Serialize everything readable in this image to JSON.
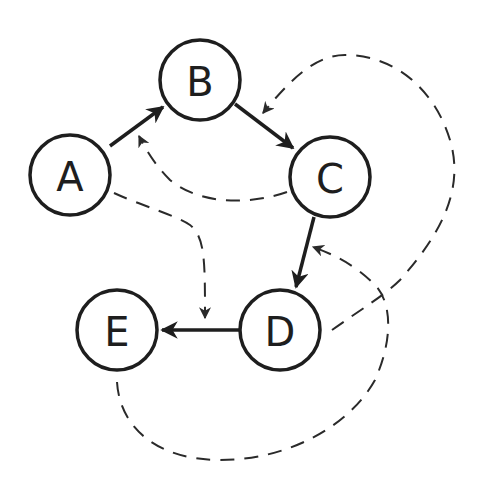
{
  "diagram": {
    "type": "directed-graph",
    "colors": {
      "stroke": "#1e1e1e",
      "background": "#ffffff"
    },
    "nodes": [
      {
        "id": "A",
        "label": "A",
        "cx": 70,
        "cy": 175
      },
      {
        "id": "B",
        "label": "B",
        "cx": 200,
        "cy": 80
      },
      {
        "id": "C",
        "label": "C",
        "cx": 330,
        "cy": 177
      },
      {
        "id": "D",
        "label": "D",
        "cx": 280,
        "cy": 330
      },
      {
        "id": "E",
        "label": "E",
        "cx": 117,
        "cy": 330
      }
    ],
    "solid_edges": [
      {
        "from": "A",
        "to": "B"
      },
      {
        "from": "B",
        "to": "C"
      },
      {
        "from": "C",
        "to": "D"
      },
      {
        "from": "D",
        "to": "E"
      }
    ],
    "dashed_edges": [
      {
        "from": "C",
        "to": "A-B edge",
        "style": "dashed"
      },
      {
        "from": "A",
        "to": "D-E edge",
        "style": "dashed"
      },
      {
        "from": "D",
        "to": "B-C edge",
        "style": "dashed"
      },
      {
        "from": "E",
        "to": "C-D edge",
        "style": "dashed"
      }
    ]
  }
}
